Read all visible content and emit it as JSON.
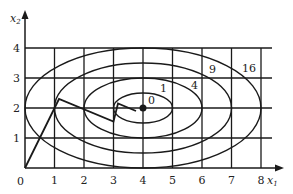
{
  "diagram": {
    "axes": {
      "x_label": "x",
      "x_sub": "1",
      "y_label": "x",
      "y_sub": "2",
      "x_ticks": [
        "0",
        "1",
        "2",
        "3",
        "4",
        "5",
        "6",
        "7",
        "8"
      ],
      "y_ticks": [
        "1",
        "2",
        "3",
        "4"
      ]
    },
    "contour_labels": [
      "0",
      "1",
      "4",
      "9",
      "16"
    ],
    "contours": [
      {
        "level": 1,
        "a": 1,
        "b": 0.5
      },
      {
        "level": 4,
        "a": 2,
        "b": 1
      },
      {
        "level": 9,
        "a": 3,
        "b": 1.5
      },
      {
        "level": 16,
        "a": 4,
        "b": 2
      }
    ],
    "center": [
      4,
      2
    ],
    "path": [
      [
        0,
        0
      ],
      [
        1.15,
        2.3
      ],
      [
        3.0,
        1.55
      ],
      [
        3.15,
        2.15
      ],
      [
        3.75,
        1.9
      ]
    ],
    "colors": {
      "ink": "#1a1a1a",
      "background": "#ffffff"
    }
  }
}
